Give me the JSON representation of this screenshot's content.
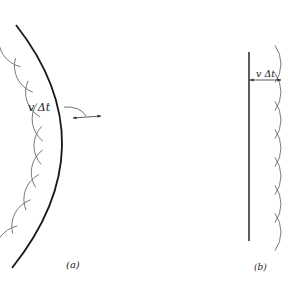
{
  "figure": {
    "panel_a": {
      "caption": "(a)",
      "distance_label": "v Δt",
      "wavefront": "curved",
      "wavelet_count": 9
    },
    "panel_b": {
      "caption": "(b)",
      "distance_label": "v Δt",
      "wavefront": "plane",
      "wavelet_count": 7
    },
    "colors": {
      "wavefront": "#1a1a1a",
      "wavelet": "#6a6a6a",
      "text": "#222222"
    }
  }
}
